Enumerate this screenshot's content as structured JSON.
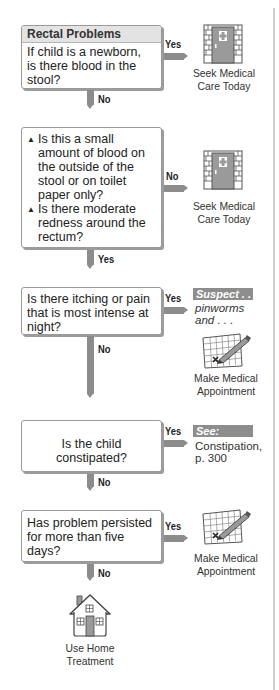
{
  "title": "Rectal Problems",
  "nodes": [
    {
      "id": "q1",
      "question": "If child is a newborn, is there blood in the stool?",
      "lines": [
        "If child is a newborn,",
        "is there blood in the",
        "stool?"
      ],
      "right_label": "Yes",
      "down_label": "No"
    },
    {
      "id": "q2",
      "bullets": [
        {
          "lines": [
            "Is this a small",
            "amount of blood on",
            "the outside of the",
            "stool or on toilet",
            "paper only?"
          ]
        },
        {
          "lines": [
            "Is there moderate",
            "redness around the",
            "rectum?"
          ]
        }
      ],
      "bullet_glyph": "▲",
      "right_label": "No",
      "down_label": "Yes"
    },
    {
      "id": "q3",
      "lines": [
        "Is there itching or pain",
        "that is most intense at",
        "night?"
      ],
      "right_label": "Yes",
      "down_label": "No"
    },
    {
      "id": "q4",
      "lines": [
        "Is the child constipated?"
      ],
      "right_label": "Yes",
      "down_label": "No"
    },
    {
      "id": "q5",
      "lines": [
        "Has problem persisted",
        "for more than five",
        "days?"
      ],
      "right_label": "Yes",
      "down_label": "No"
    }
  ],
  "outcomes": {
    "seek_care_1": {
      "icon": "hospital-door-icon",
      "lines": [
        "Seek Medical",
        "Care Today"
      ]
    },
    "seek_care_2": {
      "icon": "hospital-door-icon",
      "lines": [
        "Seek Medical",
        "Care Today"
      ]
    },
    "suspect": {
      "tag": "Suspect . . .",
      "lines": [
        "pinworms",
        "and . . ."
      ]
    },
    "appt_1": {
      "icon": "calendar-pencil-icon",
      "lines": [
        "Make Medical",
        "Appointment"
      ]
    },
    "see": {
      "tag": "See:",
      "lines": [
        "Constipation,",
        "p. 300"
      ]
    },
    "appt_2": {
      "icon": "calendar-pencil-icon",
      "lines": [
        "Make Medical",
        "Appointment"
      ]
    },
    "home": {
      "icon": "house-icon",
      "lines": [
        "Use Home",
        "Treatment"
      ]
    }
  },
  "colors": {
    "arrow": "#8c8c8c",
    "header_bg": "#e3e3e3",
    "tag_bg": "#8d8d8d",
    "door": "#9a9a9a"
  }
}
